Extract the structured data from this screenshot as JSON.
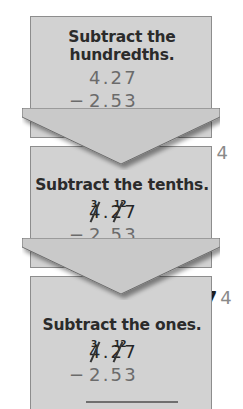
{
  "figure": {
    "colors": {
      "panel_fill": "#d2d2d2",
      "panel_border": "#8d8d8d",
      "arrow_fill": "#c9c9c9",
      "arrow_border": "#6e6e6e",
      "heading_text": "#2b2b2b",
      "digit_text": "#6b6b6b",
      "new_digit_text": "#1e1e1e",
      "old_digit_text": "#8a8a8a",
      "regroup_text": "#262626"
    }
  },
  "steps": [
    {
      "heading_line1": "Subtract the",
      "heading_line2": "hundredths.",
      "minuend": "4.27",
      "operator": "−",
      "subtrahend": "2.53",
      "regroup_over_ones": "",
      "regroup_over_tenths": "",
      "has_strikes": false,
      "answer_new": "4",
      "answer_old": "",
      "answer_full": "4"
    },
    {
      "heading_line1": "Subtract the tenths.",
      "heading_line2": "",
      "minuend": "4.27",
      "operator": "−",
      "subtrahend": "2.53",
      "regroup_over_ones": "3",
      "regroup_over_tenths": "12",
      "has_strikes": true,
      "answer_new": "7",
      "answer_old": "4",
      "answer_full": "74"
    },
    {
      "heading_line1": "Subtract the ones.",
      "heading_line2": "",
      "minuend": "4.27",
      "operator": "−",
      "subtrahend": "2.53",
      "regroup_over_ones": "3",
      "regroup_over_tenths": "12",
      "has_strikes": true,
      "answer_new": "",
      "answer_old": "",
      "answer_full": ""
    }
  ]
}
